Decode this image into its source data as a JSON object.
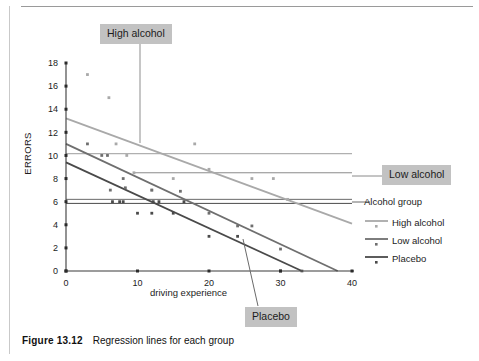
{
  "figure": {
    "caption_label": "Figure 13.12",
    "caption_text": "Regression lines for each group"
  },
  "chart_data": {
    "type": "scatter",
    "title": "",
    "xlabel": "driving experience",
    "ylabel": "ERRORS",
    "xlim": [
      0,
      40
    ],
    "ylim": [
      0,
      18
    ],
    "xticks": [
      0,
      10,
      20,
      30,
      40
    ],
    "yticks": [
      0,
      2,
      4,
      6,
      8,
      10,
      12,
      14,
      16,
      18
    ],
    "grid": false,
    "legend_position": "right",
    "legend_title": "Alcohol group",
    "series": [
      {
        "name": "High alcohol",
        "color": "#a9a9a9",
        "line": {
          "x0": 0,
          "y0": 13.2,
          "x1": 40,
          "y1": 4.1
        },
        "points": [
          [
            3,
            17.0
          ],
          [
            6,
            15.0
          ],
          [
            7,
            11.0
          ],
          [
            8.5,
            10.0
          ],
          [
            9.5,
            8.5
          ],
          [
            12,
            7.0
          ],
          [
            15,
            8.0
          ],
          [
            18,
            11.0
          ],
          [
            20,
            8.8
          ],
          [
            26,
            8.0
          ],
          [
            29,
            8.0
          ],
          [
            31,
            6.2
          ]
        ]
      },
      {
        "name": "Low alcohol",
        "color": "#6f6f6f",
        "line": {
          "x0": 0,
          "y0": 11.0,
          "x1": 38,
          "y1": 0.0
        },
        "points": [
          [
            3,
            11.0
          ],
          [
            5,
            10.0
          ],
          [
            5.8,
            10.0
          ],
          [
            6.2,
            7.0
          ],
          [
            8,
            8.0
          ],
          [
            8.3,
            7.2
          ],
          [
            12,
            7.0
          ],
          [
            16,
            6.9
          ],
          [
            20,
            5.0
          ],
          [
            24,
            3.9
          ],
          [
            26,
            3.9
          ],
          [
            30,
            1.9
          ],
          [
            33,
            0.0
          ]
        ]
      },
      {
        "name": "Placebo",
        "color": "#4a4a4a",
        "line": {
          "x0": 0,
          "y0": 9.4,
          "x1": 33,
          "y1": 0.0
        },
        "points": [
          [
            6.5,
            6.0
          ],
          [
            7.5,
            6.0
          ],
          [
            8,
            6.0
          ],
          [
            10,
            5.0
          ],
          [
            12,
            5.0
          ],
          [
            12.2,
            6.0
          ],
          [
            13,
            6.0
          ],
          [
            15,
            5.0
          ],
          [
            16.5,
            6.0
          ],
          [
            20,
            3.0
          ],
          [
            24,
            3.0
          ],
          [
            30,
            0.0
          ]
        ]
      }
    ],
    "reference_lines": [
      {
        "name": "high-alcohol-leader",
        "y": 10.15,
        "x_from": 0,
        "x_to": 40,
        "color": "#9c9c9c"
      },
      {
        "name": "low-alcohol-leader",
        "y": 8.5,
        "x_from": 9.5,
        "x_to": 40,
        "color": "#8a8a8a"
      },
      {
        "name": "alcohol-group-upper",
        "y": 6.2,
        "x_from": 0,
        "x_to": 40,
        "color": "#6a6a6a"
      },
      {
        "name": "alcohol-group-lower",
        "y": 5.85,
        "x_from": 0,
        "x_to": 40,
        "color": "#4a4a4a"
      }
    ]
  },
  "callouts": [
    {
      "id": "high",
      "label": "High alcohol"
    },
    {
      "id": "low",
      "label": "Low alcohol"
    },
    {
      "id": "placebo",
      "label": "Placebo"
    }
  ],
  "legend": {
    "title": "Alcohol group",
    "items": [
      {
        "label": "High alcohol",
        "color": "#a9a9a9"
      },
      {
        "label": "Low alcohol",
        "color": "#6f6f6f"
      },
      {
        "label": "Placebo",
        "color": "#4a4a4a"
      }
    ]
  }
}
